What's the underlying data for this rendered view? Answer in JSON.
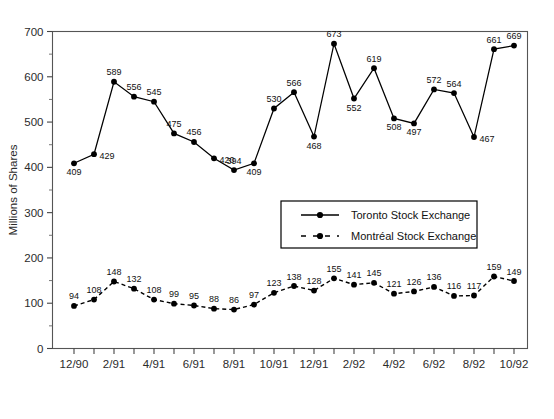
{
  "chart_data": {
    "type": "line",
    "title": "",
    "xlabel": "",
    "ylabel": "Millions of Shares",
    "ylim": [
      0,
      700
    ],
    "ytick_step": 100,
    "yminor_step": 50,
    "grid": false,
    "legend_position": "center",
    "ytick_labels": [
      "0",
      "100",
      "200",
      "300",
      "400",
      "500",
      "600",
      "700"
    ],
    "x": [
      "12/90",
      "1/91",
      "2/91",
      "3/91",
      "4/91",
      "5/91",
      "6/91",
      "7/91",
      "8/91",
      "9/91",
      "10/91",
      "11/91",
      "12/91",
      "1/92",
      "2/92",
      "3/92",
      "4/92",
      "5/92",
      "6/92",
      "7/92",
      "8/92",
      "9/92",
      "10/92"
    ],
    "xtick_labels_shown": [
      "12/90",
      "2/91",
      "4/91",
      "6/91",
      "8/91",
      "10/91",
      "12/91",
      "2/92",
      "4/92",
      "6/92",
      "8/92",
      "10/92"
    ],
    "series": [
      {
        "name": "Toronto Stock Exchange",
        "style": "solid",
        "color": "#000000",
        "values": [
          409,
          429,
          589,
          556,
          545,
          475,
          456,
          420,
          394,
          409,
          530,
          566,
          468,
          673,
          552,
          619,
          508,
          497,
          572,
          564,
          467,
          661,
          669
        ],
        "label_positions": [
          "below",
          "right",
          "above",
          "above",
          "above",
          "above",
          "above",
          "right",
          "above",
          "below",
          "above",
          "above",
          "below",
          "above",
          "below",
          "above",
          "below",
          "below",
          "above",
          "above",
          "right",
          "above",
          "above"
        ]
      },
      {
        "name": "Montréal Stock Exchange",
        "style": "dashed",
        "color": "#000000",
        "values": [
          94,
          108,
          148,
          132,
          108,
          99,
          95,
          88,
          86,
          97,
          123,
          138,
          128,
          155,
          141,
          145,
          121,
          126,
          136,
          116,
          117,
          159,
          149
        ],
        "label_positions": [
          "above",
          "above",
          "above",
          "above",
          "above",
          "above",
          "above",
          "above",
          "above",
          "above",
          "above",
          "above",
          "above",
          "above",
          "above",
          "above",
          "above",
          "above",
          "above",
          "above",
          "above",
          "above",
          "above"
        ]
      }
    ]
  },
  "legend": {
    "entries": [
      {
        "label": "Toronto Stock Exchange",
        "style": "solid"
      },
      {
        "label": "Montréal Stock Exchange",
        "style": "dashed"
      }
    ]
  },
  "axes": {
    "y_axis_title": "Millions of Shares"
  }
}
